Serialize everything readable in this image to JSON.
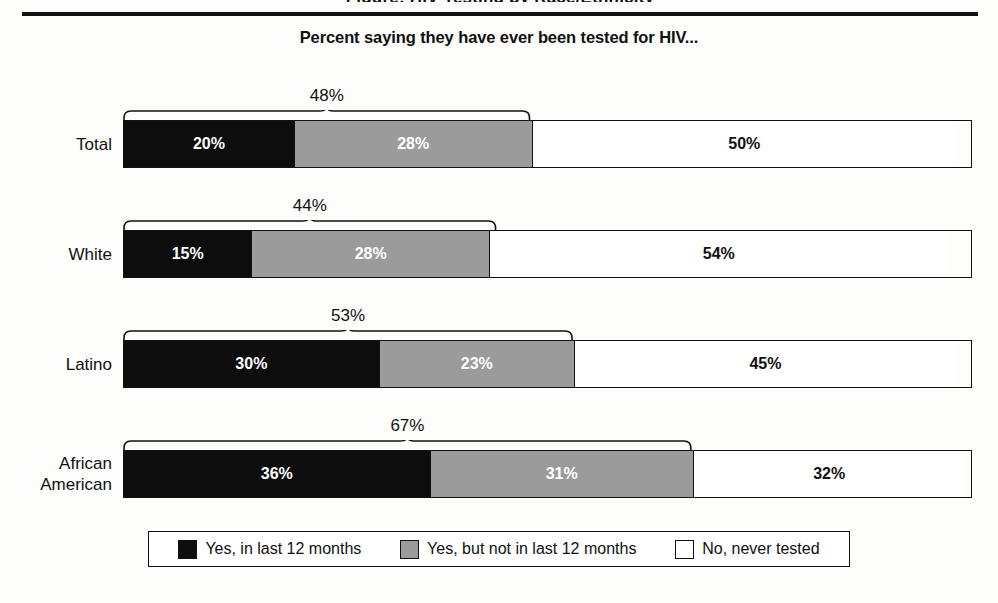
{
  "header": {
    "clipped_title": "Figure: HIV Testing by Race/Ethnicity",
    "subtitle": "Percent saying they have ever been tested for HIV..."
  },
  "legend": {
    "items": [
      {
        "label": "Yes, in last 12 months",
        "swatch": "black-swatch-icon",
        "color": "#0d0d0d"
      },
      {
        "label": "Yes, but not in last 12 months",
        "swatch": "gray-swatch-icon",
        "color": "#9b9b9b"
      },
      {
        "label": "No, never tested",
        "swatch": "white-swatch-icon",
        "color": "#ffffff"
      }
    ]
  },
  "chart_data": {
    "type": "bar",
    "subtype": "horizontal-stacked-100",
    "title": "Percent saying they have ever been tested for HIV...",
    "xlabel": "",
    "ylabel": "",
    "xlim": [
      0,
      100
    ],
    "grid": false,
    "legend_position": "bottom",
    "categories": [
      "Total",
      "White",
      "Latino",
      "African American"
    ],
    "series": [
      {
        "name": "Yes, in last 12 months",
        "color": "#0d0d0d",
        "values": [
          20,
          15,
          30,
          36
        ]
      },
      {
        "name": "Yes, but not in last 12 months",
        "color": "#9b9b9b",
        "values": [
          28,
          28,
          23,
          31
        ]
      },
      {
        "name": "No, never tested",
        "color": "#ffffff",
        "values": [
          50,
          54,
          45,
          32
        ]
      }
    ],
    "annotations": [
      {
        "category": "Total",
        "label": "48%",
        "value": 48,
        "type": "brace",
        "spans": [
          "Yes, in last 12 months",
          "Yes, but not in last 12 months"
        ]
      },
      {
        "category": "White",
        "label": "44%",
        "value": 44,
        "type": "brace",
        "spans": [
          "Yes, in last 12 months",
          "Yes, but not in last 12 months"
        ]
      },
      {
        "category": "Latino",
        "label": "53%",
        "value": 53,
        "type": "brace",
        "spans": [
          "Yes, in last 12 months",
          "Yes, but not in last 12 months"
        ]
      },
      {
        "category": "African American",
        "label": "67%",
        "value": 67,
        "type": "brace",
        "spans": [
          "Yes, in last 12 months",
          "Yes, but not in last 12 months"
        ]
      }
    ],
    "rows": [
      {
        "label": "Total",
        "label_line1": "Total",
        "label_line2": "",
        "brace_label": "48%",
        "brace_value": 48,
        "segments": [
          {
            "label": "20%",
            "value": 20,
            "fill": "black"
          },
          {
            "label": "28%",
            "value": 28,
            "fill": "gray"
          },
          {
            "label": "50%",
            "value": 50,
            "fill": "white"
          }
        ]
      },
      {
        "label": "White",
        "label_line1": "White",
        "label_line2": "",
        "brace_label": "44%",
        "brace_value": 44,
        "segments": [
          {
            "label": "15%",
            "value": 15,
            "fill": "black"
          },
          {
            "label": "28%",
            "value": 28,
            "fill": "gray"
          },
          {
            "label": "54%",
            "value": 54,
            "fill": "white"
          }
        ]
      },
      {
        "label": "Latino",
        "label_line1": "Latino",
        "label_line2": "",
        "brace_label": "53%",
        "brace_value": 53,
        "segments": [
          {
            "label": "30%",
            "value": 30,
            "fill": "black"
          },
          {
            "label": "23%",
            "value": 23,
            "fill": "gray"
          },
          {
            "label": "45%",
            "value": 45,
            "fill": "white"
          }
        ]
      },
      {
        "label": "African American",
        "label_line1": "African",
        "label_line2": "American",
        "brace_label": "67%",
        "brace_value": 67,
        "segments": [
          {
            "label": "36%",
            "value": 36,
            "fill": "black"
          },
          {
            "label": "31%",
            "value": 31,
            "fill": "gray"
          },
          {
            "label": "32%",
            "value": 32,
            "fill": "white"
          }
        ]
      }
    ]
  }
}
